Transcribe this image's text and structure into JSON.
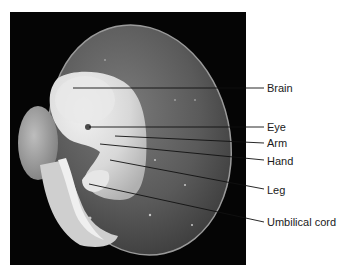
{
  "figure": {
    "labels": [
      {
        "id": "brain",
        "text": "Brain"
      },
      {
        "id": "eye",
        "text": "Eye"
      },
      {
        "id": "arm",
        "text": "Arm"
      },
      {
        "id": "hand",
        "text": "Hand"
      },
      {
        "id": "leg",
        "text": "Leg"
      },
      {
        "id": "umbilical-cord",
        "text": "Umbilical cord"
      }
    ]
  }
}
